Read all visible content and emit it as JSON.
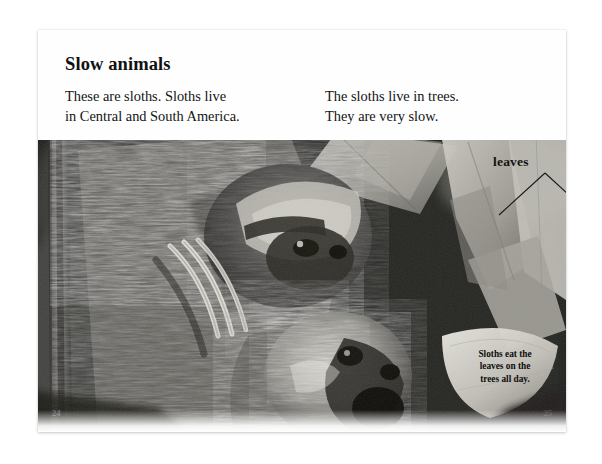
{
  "spread": {
    "title": "Slow animals",
    "text_left": "These are sloths. Sloths live\nin Central and South America.",
    "text_right": "The sloths live in trees.\nThey are very slow.",
    "callout_leaves": "leaves",
    "caption": "Sloths eat the\nleaves on the\ntrees all day.",
    "page_number_left": "24",
    "page_number_right": "25"
  },
  "photo": {
    "subject": "two sloths in a tree",
    "palette": {
      "background_dark": "#1b1b1b",
      "fur_mid": "#8d8d8d",
      "fur_light": "#d4d2cc",
      "leaf_light": "#b9b7b0",
      "leaf_mid": "#9a9892",
      "branch_dark": "#141414",
      "page_background": "#ffffff"
    }
  }
}
